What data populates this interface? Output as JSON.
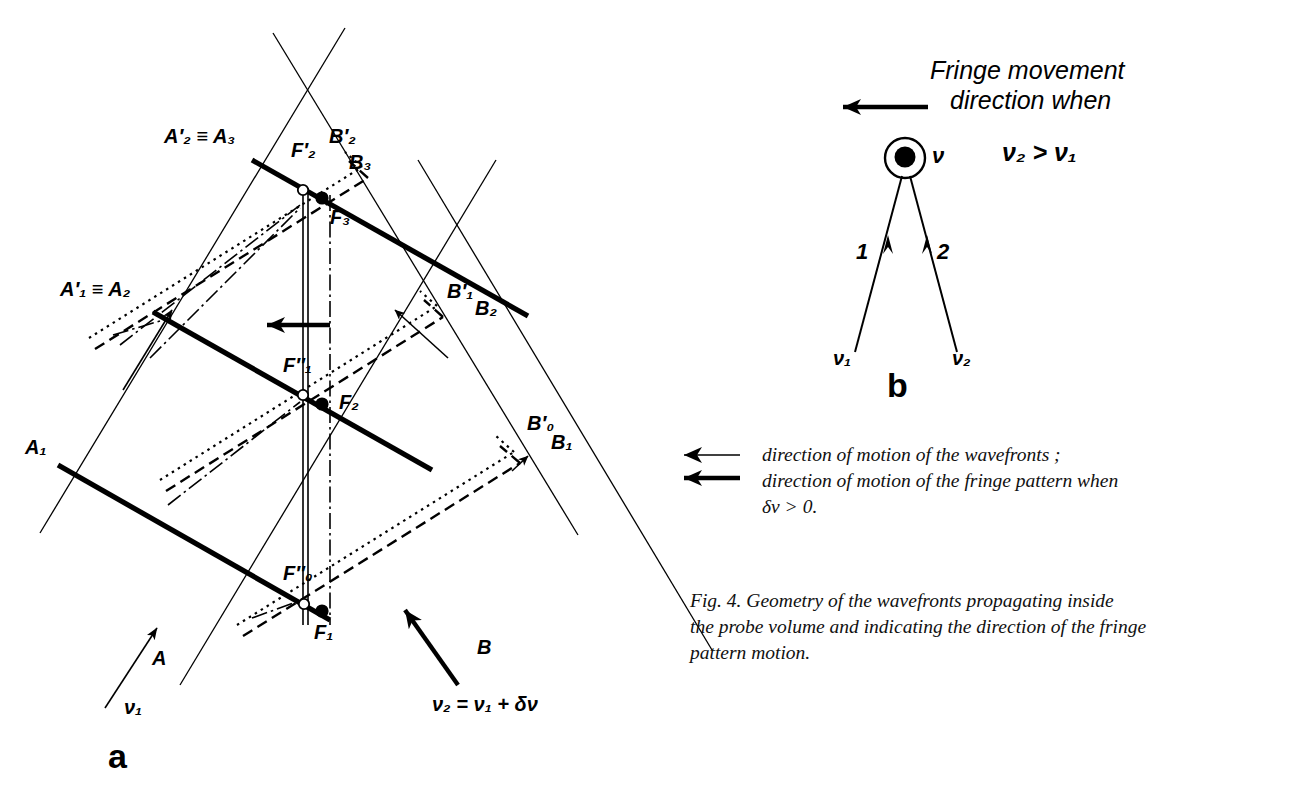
{
  "figure": {
    "panel_a_letter": "a",
    "panel_b_letter": "b"
  },
  "panel_a": {
    "labels": {
      "A1": "A₁",
      "A1p_eq_A2": "A′₁ ≡ A₂",
      "A2p_eq_A3": "A′₂ ≡ A₃",
      "B1p": "B′₁",
      "B2": "B₂",
      "B2p": "B′₂",
      "B3": "B₃",
      "B0p": "B′₀",
      "B1": "B₁",
      "F0pp": "F″₀",
      "F1": "F₁",
      "F1pp": "F″₁",
      "F2": "F₂",
      "F2p": "F′₂",
      "F3": "F₃"
    },
    "beam_a_label": "A",
    "beam_a_freq": "ν₁",
    "beam_b_label": "B",
    "beam_b_freq": "ν₂ = ν₁ + δν"
  },
  "panel_b": {
    "title_line1": "Fringe movement",
    "title_line2": "direction when",
    "condition": "ν₂ > ν₁",
    "scatterer_label": "ν",
    "beam1_number": "1",
    "beam2_number": "2",
    "beam1_freq": "ν₁",
    "beam2_freq": "ν₂"
  },
  "legend": {
    "entries": [
      {
        "style": "thin-arrow",
        "text": "direction of motion of the wavefronts ;"
      },
      {
        "style": "bold-arrow",
        "text": "direction of motion of the fringe pattern when\nδν > 0."
      }
    ]
  },
  "caption": {
    "text": "Fig. 4. Geometry of the wavefronts propagating inside\nthe probe volume and indicating the direction of the fringe\npattern motion."
  },
  "colors": {
    "ink": "#000000",
    "paper": "#ffffff"
  }
}
